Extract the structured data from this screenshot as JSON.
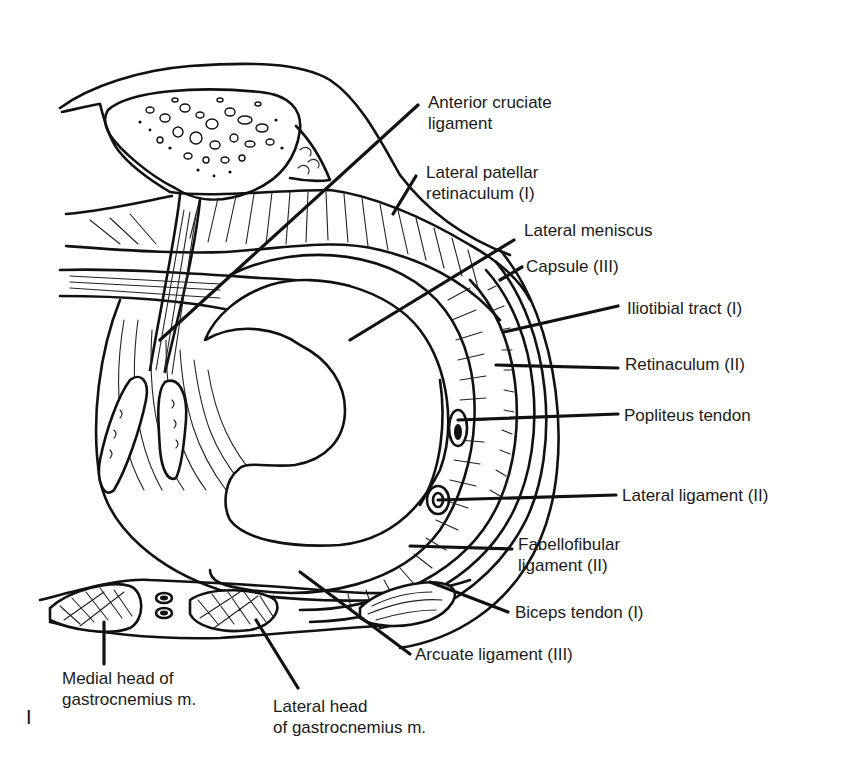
{
  "figure": {
    "number_label": "I"
  },
  "labels": {
    "anterior_cruciate": [
      "Anterior cruciate",
      "ligament"
    ],
    "lateral_patellar_retinaculum": [
      "Lateral patellar",
      "retinaculum (I)"
    ],
    "lateral_meniscus": [
      "Lateral meniscus"
    ],
    "capsule": [
      "Capsule (III)"
    ],
    "iliotibial_tract": [
      "Iliotibial tract (I)"
    ],
    "retinaculum": [
      "Retinaculum (II)"
    ],
    "popliteus_tendon": [
      "Popliteus tendon"
    ],
    "lateral_ligament": [
      "Lateral ligament (II)"
    ],
    "fabellofibular_ligament": [
      "Fabellofibular",
      "ligament (II)"
    ],
    "biceps_tendon": [
      "Biceps tendon (I)"
    ],
    "arcuate_ligament": [
      "Arcuate ligament (III)"
    ],
    "medial_head_gastrocnemius": [
      "Medial head of",
      "gastrocnemius m."
    ],
    "lateral_head_gastrocnemius": [
      "Lateral head",
      "of gastrocnemius m."
    ]
  },
  "colors": {
    "ink": "#111111",
    "background": "#ffffff"
  }
}
